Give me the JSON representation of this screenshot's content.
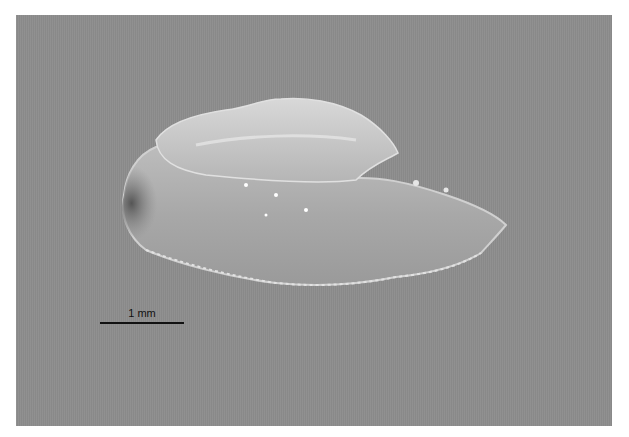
{
  "image": {
    "subject": "translucent otolith specimen on gray background",
    "background_color": "#8d8d8d"
  },
  "scale_bar": {
    "label": "1 mm"
  }
}
